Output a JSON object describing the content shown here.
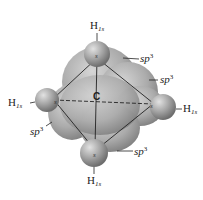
{
  "diagram": {
    "title": "",
    "central_atom": {
      "label": "C"
    },
    "hydrogens": [
      {
        "id": "top",
        "label_main": "H",
        "label_sub": "1s"
      },
      {
        "id": "left",
        "label_main": "H",
        "label_sub": "1s"
      },
      {
        "id": "right",
        "label_main": "H",
        "label_sub": "1s"
      },
      {
        "id": "bottom",
        "label_main": "H",
        "label_sub": "1s"
      }
    ],
    "orbitals": [
      {
        "id": "sp3-top-right",
        "label_main": "sp",
        "label_sup": "3"
      },
      {
        "id": "sp3-right",
        "label_main": "sp",
        "label_sup": "3"
      },
      {
        "id": "sp3-left",
        "label_main": "sp",
        "label_sup": "3"
      },
      {
        "id": "sp3-bottom",
        "label_main": "sp",
        "label_sup": "3"
      }
    ],
    "colors": {
      "orbital_fill": "#a8a8a8",
      "sphere_fill": "#9a9a9a",
      "line": "#222222",
      "background": "#ffffff"
    }
  }
}
